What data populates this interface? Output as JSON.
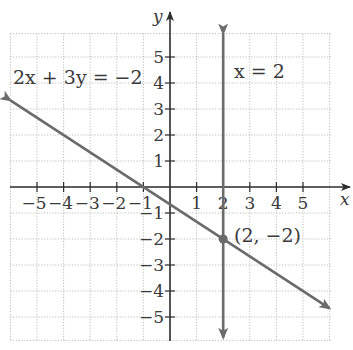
{
  "chart_data": {
    "type": "line",
    "title": "",
    "xlabel": "x",
    "ylabel": "y",
    "xlim": [
      -6,
      6
    ],
    "ylim": [
      -6,
      6
    ],
    "grid": true,
    "grid_style": "dotted",
    "x_ticks": [
      -5,
      -4,
      -3,
      -2,
      -1,
      1,
      2,
      3,
      4,
      5
    ],
    "y_ticks": [
      5,
      4,
      3,
      2,
      1,
      -1,
      -2,
      -3,
      -4,
      -5
    ],
    "x_tick_labels": [
      "−5",
      "−4",
      "−3",
      "−2",
      "−1",
      "1",
      "2",
      "3",
      "4",
      "5"
    ],
    "y_tick_labels": [
      "5",
      "4",
      "3",
      "2",
      "1",
      "−1",
      "−2",
      "−3",
      "−4",
      "−5"
    ],
    "series": [
      {
        "name": "2x + 3y = −2",
        "kind": "line",
        "equation": "2x + 3y = -2",
        "slope": -0.6667,
        "intercept": -0.6667,
        "x": [
          -6,
          6
        ],
        "y": [
          3.333,
          -4.667
        ],
        "color": "#6b6b6b",
        "arrows": "both"
      },
      {
        "name": "x = 2",
        "kind": "vertical-line",
        "equation": "x = 2",
        "x": [
          2,
          2
        ],
        "y": [
          5.9,
          -5.8
        ],
        "color": "#6b6b6b",
        "arrows": "both"
      }
    ],
    "points": [
      {
        "x": 2,
        "y": -2,
        "label": "(2, −2)"
      }
    ],
    "annotations": [
      {
        "text": "2x + 3y = −2",
        "near": [
          -5.5,
          4.3
        ]
      },
      {
        "text": "x = 2",
        "near": [
          2.4,
          4.3
        ]
      }
    ]
  },
  "labels": {
    "line1": "2x + 3y = −2",
    "line2": "x = 2",
    "point": "(2, −2)",
    "x_axis": "x",
    "y_axis": "y"
  },
  "colors": {
    "axis": "#2e2e2e",
    "grid": "#bdbdbd",
    "line": "#6b6b6b",
    "text": "#3a3a3a"
  }
}
